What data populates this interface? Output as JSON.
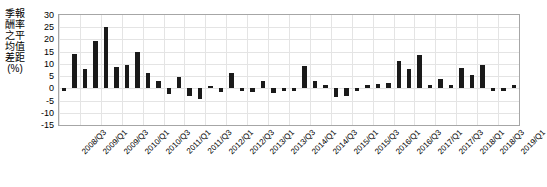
{
  "chart_data": {
    "type": "bar",
    "title": "",
    "subtitle": "",
    "xlabel": "",
    "ylabel": "季報酬率之平均值差距(%)",
    "ylim": [
      -15,
      30
    ],
    "ytick_step": 5,
    "yticks": [
      30,
      25,
      20,
      15,
      10,
      5,
      0,
      -5,
      -10,
      -15
    ],
    "grid": true,
    "legend": false,
    "legend_position": "none",
    "bar_color": "#1a1a1a",
    "categories": [
      "2008/Q3",
      "2008/Q4",
      "2009/Q1",
      "2009/Q2",
      "2009/Q3",
      "2009/Q4",
      "2010/Q1",
      "2010/Q2",
      "2010/Q3",
      "2010/Q4",
      "2011/Q1",
      "2011/Q2",
      "2011/Q3",
      "2011/Q4",
      "2012/Q1",
      "2012/Q2",
      "2012/Q3",
      "2012/Q4",
      "2013/Q1",
      "2013/Q2",
      "2013/Q3",
      "2013/Q4",
      "2014/Q1",
      "2014/Q2",
      "2014/Q3",
      "2014/Q4",
      "2015/Q1",
      "2015/Q2",
      "2015/Q3",
      "2015/Q4",
      "2016/Q1",
      "2016/Q2",
      "2016/Q3",
      "2016/Q4",
      "2017/Q1",
      "2017/Q2",
      "2017/Q3",
      "2017/Q4",
      "2018/Q1",
      "2018/Q2",
      "2018/Q3",
      "2018/Q4",
      "2019/Q1",
      "2019/Q2"
    ],
    "values": [
      -1.0,
      14.2,
      8.0,
      19.3,
      25.2,
      8.8,
      9.4,
      14.8,
      6.2,
      2.9,
      -2.5,
      4.5,
      -3.0,
      -4.5,
      1.0,
      -1.5,
      6.2,
      -1.0,
      -1.5,
      2.8,
      -2.0,
      -1.0,
      -1.0,
      9.3,
      3.2,
      1.2,
      -3.5,
      -3.0,
      -1.0,
      1.2,
      1.8,
      2.2,
      11.0,
      7.8,
      13.8,
      1.2,
      4.0,
      1.2,
      8.2,
      5.6,
      9.4,
      -1.2,
      -1.0,
      1.2
    ],
    "xtick_labels": [
      "2008/Q3",
      "2009/Q1",
      "2009/Q3",
      "2010/Q1",
      "2010/Q3",
      "2011/Q1",
      "2011/Q3",
      "2012/Q1",
      "2012/Q3",
      "2013/Q1",
      "2013/Q3",
      "2014/Q1",
      "2014/Q3",
      "2015/Q1",
      "2015/Q3",
      "2016/Q1",
      "2016/Q3",
      "2017/Q1",
      "2017/Q3",
      "2018/Q1",
      "2018/Q3",
      "2019/Q1"
    ],
    "xtick_indices": [
      0,
      2,
      4,
      6,
      8,
      10,
      12,
      14,
      16,
      18,
      20,
      22,
      24,
      26,
      28,
      30,
      32,
      34,
      36,
      38,
      40,
      42
    ]
  }
}
